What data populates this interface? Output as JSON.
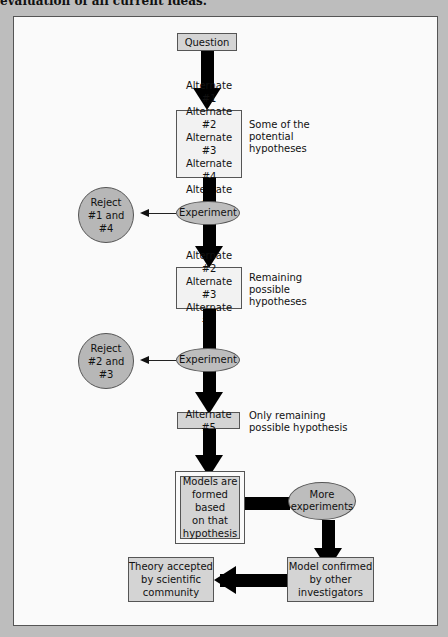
{
  "caption": "evaluation of all current ideas.",
  "nodes": {
    "question": "Question",
    "alternates_1": [
      "Alternate #1",
      "Alternate #2",
      "Alternate #3",
      "Alternate #4",
      "Alternate #5"
    ],
    "note_1": [
      "Some of the",
      "potential",
      "hypotheses"
    ],
    "experiment_1": "Experiment",
    "reject_1": [
      "Reject",
      "#1 and #4"
    ],
    "alternates_2": [
      "Alternate #2",
      "Alternate #3",
      "Alternate #5"
    ],
    "note_2": [
      "Remaining",
      "possible",
      "hypotheses"
    ],
    "experiment_2": "Experiment",
    "reject_2": [
      "Reject",
      "#2 and #3"
    ],
    "alternate_final": "Alternate #5",
    "note_3": [
      "Only remaining",
      "possible hypothesis"
    ],
    "models": [
      "Models are",
      "formed based",
      "on that",
      "hypothesis"
    ],
    "more_experiments": [
      "More",
      "experiments"
    ],
    "model_confirmed": [
      "Model confirmed",
      "by other",
      "investigators"
    ],
    "theory_accepted": [
      "Theory accepted",
      "by scientific",
      "community"
    ]
  },
  "colors": {
    "page_bg": "#bdbdbd",
    "panel_bg": "#fafafa",
    "box_fill": "#d4d4d4",
    "ellipse_fill": "#bdbdbd",
    "arrow": "#000000"
  }
}
